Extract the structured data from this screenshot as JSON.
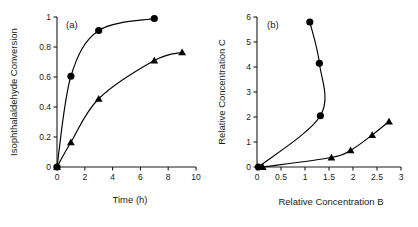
{
  "figure": {
    "background": "#ffffff",
    "ink": "#1a1a1a",
    "marker_color": "#000000"
  },
  "chart_data": [
    {
      "type": "line",
      "panel_label": "(a)",
      "title": "",
      "xlabel": "Time (h)",
      "ylabel": "Isophthalaldehyde Conversion",
      "xlim": [
        0,
        10
      ],
      "ylim": [
        0,
        1
      ],
      "xticks": [
        0,
        2,
        4,
        6,
        8,
        10
      ],
      "xticklabels": [
        "0",
        "2",
        "4",
        "6",
        "8",
        "10"
      ],
      "yticks": [
        0,
        0.2,
        0.4,
        0.6,
        0.8,
        1
      ],
      "yticklabels": [
        "0",
        "0.2",
        "0.4",
        "0.6",
        "0.8",
        "1"
      ],
      "grid": false,
      "legend": "none",
      "series": [
        {
          "name": "circle-series",
          "marker": "filled-circle",
          "x": [
            0,
            1,
            3,
            7
          ],
          "y": [
            0,
            0.605,
            0.91,
            0.99
          ]
        },
        {
          "name": "triangle-series",
          "marker": "filled-triangle",
          "x": [
            0,
            1,
            3,
            7,
            9
          ],
          "y": [
            0,
            0.165,
            0.455,
            0.71,
            0.765
          ]
        }
      ]
    },
    {
      "type": "line",
      "panel_label": "(b)",
      "title": "",
      "xlabel": "Relative Concentration B",
      "ylabel": "Relative Concentration C",
      "xlim": [
        0,
        3
      ],
      "ylim": [
        0,
        6
      ],
      "xticks": [
        0,
        0.5,
        1,
        1.5,
        2,
        2.5,
        3
      ],
      "xticklabels": [
        "0",
        "0.5",
        "1",
        "1.5",
        "2",
        "2.5",
        "3"
      ],
      "yticks": [
        0,
        1,
        2,
        3,
        4,
        5,
        6
      ],
      "yticklabels": [
        "0",
        "1",
        "2",
        "3",
        "4",
        "5",
        "6"
      ],
      "grid": false,
      "legend": "none",
      "series": [
        {
          "name": "circle-series",
          "marker": "filled-circle",
          "x": [
            0.03,
            1.32,
            1.3,
            1.1
          ],
          "y": [
            0.0,
            2.05,
            4.15,
            5.8
          ]
        },
        {
          "name": "triangle-series",
          "marker": "filled-triangle",
          "x": [
            0.12,
            1.55,
            1.95,
            2.4,
            2.75
          ],
          "y": [
            0.0,
            0.38,
            0.67,
            1.28,
            1.82
          ]
        }
      ]
    }
  ]
}
